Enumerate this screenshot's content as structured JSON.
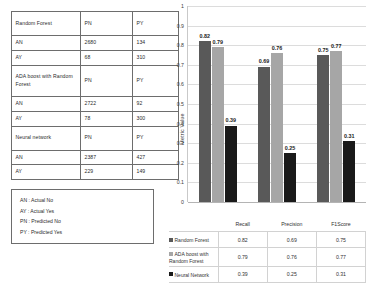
{
  "confusion_table": {
    "rows": [
      {
        "type": "header",
        "cells": [
          "Random Forest",
          "PN",
          "PY"
        ]
      },
      {
        "type": "data",
        "cells": [
          "AN",
          "2680",
          "134"
        ]
      },
      {
        "type": "data",
        "cells": [
          "AY",
          "68",
          "310"
        ]
      },
      {
        "type": "header",
        "cells": [
          "ADA boost with Random Forest",
          "PN",
          "PY"
        ]
      },
      {
        "type": "data",
        "cells": [
          "AN",
          "2722",
          "92"
        ]
      },
      {
        "type": "data",
        "cells": [
          "AY",
          "78",
          "300"
        ]
      },
      {
        "type": "header",
        "cells": [
          "Neural network",
          "PN",
          "PY"
        ]
      },
      {
        "type": "data",
        "cells": [
          "AN",
          "2387",
          "427"
        ]
      },
      {
        "type": "data",
        "cells": [
          "AY",
          "229",
          "149"
        ]
      }
    ]
  },
  "key_box": {
    "lines": [
      "AN : Actual No",
      "AY : Actual Yes",
      "PN : Predicted No",
      "PY : Predicted Yes"
    ]
  },
  "chart_data": {
    "type": "bar",
    "title": "",
    "xlabel": "",
    "ylabel": "Metric Value",
    "ylim": [
      0,
      1
    ],
    "ytick_labels": [
      "0",
      "0.1",
      "0.2",
      "0.3",
      "0.4",
      "0.5",
      "0.6",
      "0.7",
      "0.8",
      "0.9",
      "1"
    ],
    "ytick_values": [
      0,
      0.1,
      0.2,
      0.3,
      0.4,
      0.5,
      0.6,
      0.7,
      0.8,
      0.9,
      1
    ],
    "grid": true,
    "legend_position": "bottom-table",
    "categories": [
      "Recall",
      "Precision",
      "F1Score"
    ],
    "series": [
      {
        "name": "Random Forest",
        "color": "#595959",
        "values": [
          0.82,
          0.69,
          0.75
        ],
        "labels": [
          "0.82",
          "0.69",
          "0.75"
        ]
      },
      {
        "name": "ADA boost with Random Forest",
        "color": "#a6a6a6",
        "values": [
          0.79,
          0.76,
          0.77
        ],
        "labels": [
          "0.79",
          "0.76",
          "0.77"
        ]
      },
      {
        "name": "Neural Network",
        "color": "#1a1a1a",
        "values": [
          0.39,
          0.25,
          0.31
        ],
        "labels": [
          "0.39",
          "0.25",
          "0.31"
        ]
      }
    ]
  }
}
